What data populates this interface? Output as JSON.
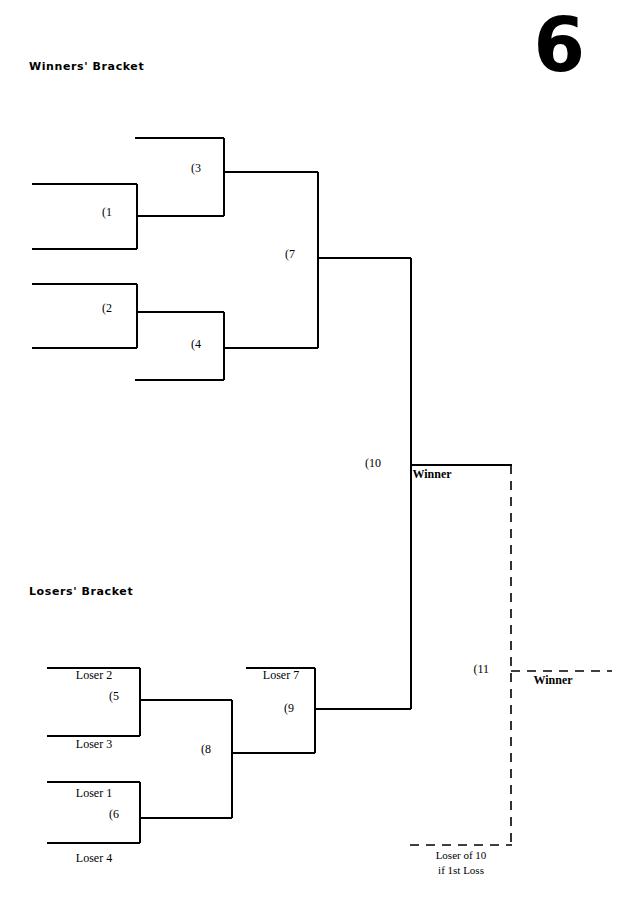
{
  "page": {
    "number": "6",
    "width": 621,
    "height": 907,
    "background": "#ffffff",
    "ink_color": "#000000"
  },
  "headings": {
    "winners": "Winners' Bracket",
    "losers": "Losers' Bracket"
  },
  "chart_data": {
    "type": "diagram",
    "game_numbers": [
      "(1",
      "(2",
      "(3",
      "(4",
      "(5",
      "(6",
      "(7",
      "(8",
      "(9",
      "(10",
      "(11"
    ],
    "entry_slots": [
      "Loser 1",
      "Loser 2",
      "Loser 3",
      "Loser 4",
      "Loser 7"
    ],
    "outcomes": [
      "Winner",
      "Winner"
    ],
    "notes": [
      "Loser of 10",
      "if 1st Loss"
    ]
  },
  "winners_bracket": {
    "nodes": [
      {
        "id": "g1",
        "label": "(1",
        "x": 112,
        "y": 216
      },
      {
        "id": "g2",
        "label": "(2",
        "x": 112,
        "y": 312
      },
      {
        "id": "g3",
        "label": "(3",
        "x": 201,
        "y": 172
      },
      {
        "id": "g4",
        "label": "(4",
        "x": 201,
        "y": 348
      },
      {
        "id": "g7",
        "label": "(7",
        "x": 295,
        "y": 258
      },
      {
        "id": "g10",
        "label": "(10",
        "x": 381,
        "y": 467
      }
    ],
    "outcome": {
      "label": "Winner",
      "x": 432,
      "y": 478
    }
  },
  "losers_bracket": {
    "nodes": [
      {
        "id": "g5",
        "label": "(5",
        "x": 119,
        "y": 700
      },
      {
        "id": "g6",
        "label": "(6",
        "x": 119,
        "y": 818
      },
      {
        "id": "g8",
        "label": "(8",
        "x": 211,
        "y": 753
      },
      {
        "id": "g9",
        "label": "(9",
        "x": 294,
        "y": 712
      },
      {
        "id": "g11",
        "label": "(11",
        "x": 489,
        "y": 673
      }
    ],
    "slots": [
      {
        "label": "Loser 2",
        "x": 94,
        "y": 679
      },
      {
        "label": "Loser 3",
        "x": 94,
        "y": 748
      },
      {
        "label": "Loser 1",
        "x": 94,
        "y": 797
      },
      {
        "label": "Loser 4",
        "x": 94,
        "y": 862
      },
      {
        "label": "Loser 7",
        "x": 281,
        "y": 679
      }
    ],
    "outcome": {
      "label": "Winner",
      "x": 553,
      "y": 684
    },
    "notes": [
      {
        "label": "Loser of 10",
        "x": 461,
        "y": 859
      },
      {
        "label": "if 1st Loss",
        "x": 461,
        "y": 874
      }
    ]
  },
  "geometry": {
    "solid_paths": [
      "M 32 184 L 137 184",
      "M 32 249 L 137 249",
      "M 137 184 L 137 249",
      "M 137 216 L 224 216",
      "M 135 138 L 224 138",
      "M 224 138 L 224 216",
      "M 224 172 L 318 172",
      "M 32 284 L 137 284",
      "M 32 348 L 137 348",
      "M 137 284 L 137 348",
      "M 137 312 L 224 312",
      "M 135 380 L 224 380",
      "M 224 312 L 224 380",
      "M 224 348 L 318 348",
      "M 318 172 L 318 348",
      "M 318 258 L 411 258",
      "M 47 668 L 140 668",
      "M 47 736 L 140 736",
      "M 140 668 L 140 736",
      "M 140 700 L 232 700",
      "M 47 782 L 140 782",
      "M 47 843 L 140 843",
      "M 140 782 L 140 843",
      "M 140 818 L 232 818",
      "M 232 700 L 232 818",
      "M 232 753 L 315 753",
      "M 246 668 L 315 668",
      "M 315 668 L 315 753",
      "M 315 709 L 411 709",
      "M 411 258 L 411 709",
      "M 411 465 L 512 465"
    ],
    "dashed_paths": [
      "M 511 465 L 511 845",
      "M 511 671 L 612 671",
      "M 410 845 L 512 845"
    ]
  }
}
